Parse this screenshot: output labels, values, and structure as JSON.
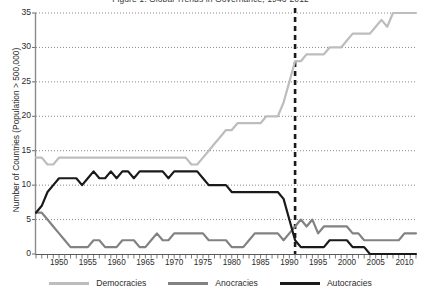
{
  "title": "Figure 1. Global Trends in Governance, 1946-2012",
  "axes": {
    "ylabel": "Number of Countries (Population > 500,000)",
    "xlabel": "",
    "y_ticks": [
      0,
      5,
      10,
      15,
      20,
      25,
      30,
      35
    ],
    "x_tick_labels": [
      1950,
      1955,
      1960,
      1965,
      1970,
      1975,
      1980,
      1985,
      1990,
      1995,
      2000,
      2005,
      2010
    ]
  },
  "legend": {
    "position": "bottom",
    "items": [
      {
        "label": "Democracies",
        "color": "#bdbdbd",
        "name": "legend-democracies"
      },
      {
        "label": "Anocracies",
        "color": "#828282",
        "name": "legend-anocracies"
      },
      {
        "label": "Autocracies",
        "color": "#1a1a1a",
        "name": "legend-autocracies"
      }
    ]
  },
  "annotations": [
    {
      "type": "vline",
      "x": 1991,
      "style": "dashed",
      "color": "#1a1a1a",
      "name": "cold-war-end-marker"
    }
  ],
  "chart_data": {
    "type": "line",
    "title": "Figure 1. Global Trends in Governance, 1946-2012",
    "xlabel": "",
    "ylabel": "Number of Countries (Population > 500,000)",
    "xlim": [
      1946,
      2012
    ],
    "ylim": [
      0,
      35
    ],
    "grid": true,
    "grid_axis": "y",
    "legend_position": "bottom",
    "x": [
      1946,
      1947,
      1948,
      1949,
      1950,
      1951,
      1952,
      1953,
      1954,
      1955,
      1956,
      1957,
      1958,
      1959,
      1960,
      1961,
      1962,
      1963,
      1964,
      1965,
      1966,
      1967,
      1968,
      1969,
      1970,
      1971,
      1972,
      1973,
      1974,
      1975,
      1976,
      1977,
      1978,
      1979,
      1980,
      1981,
      1982,
      1983,
      1984,
      1985,
      1986,
      1987,
      1988,
      1989,
      1990,
      1991,
      1992,
      1993,
      1994,
      1995,
      1996,
      1997,
      1998,
      1999,
      2000,
      2001,
      2002,
      2003,
      2004,
      2005,
      2006,
      2007,
      2008,
      2009,
      2010,
      2011,
      2012
    ],
    "series": [
      {
        "name": "Democracies",
        "color": "#bdbdbd",
        "values": [
          14,
          14,
          13,
          13,
          14,
          14,
          14,
          14,
          14,
          14,
          14,
          14,
          14,
          14,
          14,
          14,
          14,
          14,
          14,
          14,
          14,
          14,
          14,
          14,
          14,
          14,
          14,
          13,
          13,
          14,
          15,
          16,
          17,
          18,
          18,
          19,
          19,
          19,
          19,
          19,
          20,
          20,
          20,
          22,
          25,
          28,
          28,
          29,
          29,
          29,
          29,
          30,
          30,
          30,
          31,
          32,
          32,
          32,
          32,
          33,
          34,
          33,
          35,
          35,
          35,
          35,
          35
        ]
      },
      {
        "name": "Anocracies",
        "color": "#828282",
        "values": [
          6,
          6,
          5,
          4,
          3,
          2,
          1,
          1,
          1,
          1,
          2,
          2,
          1,
          1,
          1,
          2,
          2,
          2,
          1,
          1,
          2,
          3,
          2,
          2,
          3,
          3,
          3,
          3,
          3,
          3,
          2,
          2,
          2,
          2,
          1,
          1,
          1,
          2,
          3,
          3,
          3,
          3,
          3,
          2,
          3,
          4,
          5,
          4,
          5,
          3,
          4,
          4,
          4,
          4,
          4,
          3,
          3,
          2,
          2,
          2,
          2,
          2,
          2,
          2,
          3,
          3,
          3
        ]
      },
      {
        "name": "Autocracies",
        "color": "#1a1a1a",
        "values": [
          6,
          7,
          9,
          10,
          11,
          11,
          11,
          11,
          10,
          11,
          12,
          11,
          11,
          12,
          11,
          12,
          12,
          11,
          12,
          12,
          12,
          12,
          12,
          11,
          12,
          12,
          12,
          12,
          12,
          11,
          10,
          10,
          10,
          10,
          9,
          9,
          9,
          9,
          9,
          9,
          9,
          9,
          9,
          8,
          5,
          2,
          1,
          1,
          1,
          1,
          1,
          2,
          2,
          2,
          2,
          1,
          1,
          1,
          0,
          0,
          0,
          0,
          0,
          0,
          0,
          0,
          0
        ]
      }
    ]
  }
}
